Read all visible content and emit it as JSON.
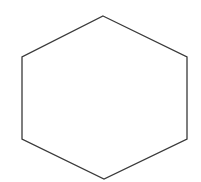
{
  "diagram": {
    "shape": "hexagon",
    "orientation": "pointy-top",
    "background": "#ffffff",
    "fill": "#ffffff",
    "stroke": "#3a3a3a",
    "stroke_width": 1.3,
    "vertices": [
      [
        103,
        16
      ],
      [
        187,
        57
      ],
      [
        187,
        139
      ],
      [
        104,
        179
      ],
      [
        22,
        139
      ],
      [
        22,
        57
      ]
    ]
  }
}
